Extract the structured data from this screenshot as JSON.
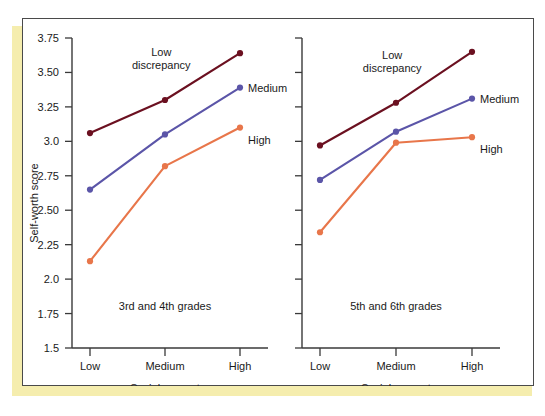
{
  "figure": {
    "y_axis_label": "Self-worth score",
    "colors": {
      "low_discrepancy": "#6b1020",
      "medium": "#5b55a8",
      "high": "#e8764a",
      "axis": "#3a3a3a",
      "accent_band": "#f5edae",
      "panel_border": "#4a4a4a",
      "text": "#1a1a1a"
    }
  },
  "chart_data": [
    {
      "type": "line",
      "title": "3rd and 4th grades",
      "xlabel": "Social support",
      "ylabel": "Self-worth score",
      "categories": [
        "Low",
        "Medium",
        "High"
      ],
      "ylim": [
        1.5,
        3.75
      ],
      "yticks": [
        "1.5",
        "1.75",
        "2.0",
        "2.25",
        "2.50",
        "2.75",
        "3.0",
        "3.25",
        "3.50",
        "3.75"
      ],
      "ytick_values": [
        1.5,
        1.75,
        2.0,
        2.25,
        2.5,
        2.75,
        3.0,
        3.25,
        3.5,
        3.75
      ],
      "grid": false,
      "legend_position": "inline-annotations",
      "series": [
        {
          "name": "Low discrepancy",
          "label": "Low\ndiscrepancy",
          "values": [
            3.06,
            3.3,
            3.64
          ],
          "color": "#6b1020"
        },
        {
          "name": "Medium",
          "label": "Medium",
          "values": [
            2.65,
            3.05,
            3.39
          ],
          "color": "#5b55a8"
        },
        {
          "name": "High",
          "label": "High",
          "values": [
            2.13,
            2.82,
            3.1
          ],
          "color": "#e8764a"
        }
      ]
    },
    {
      "type": "line",
      "title": "5th and 6th grades",
      "xlabel": "Social support",
      "ylabel": "Self-worth score",
      "categories": [
        "Low",
        "Medium",
        "High"
      ],
      "ylim": [
        1.5,
        3.75
      ],
      "yticks": [
        "1.5",
        "1.75",
        "2.0",
        "2.25",
        "2.50",
        "2.75",
        "3.0",
        "3.25",
        "3.50",
        "3.75"
      ],
      "ytick_values": [
        1.5,
        1.75,
        2.0,
        2.25,
        2.5,
        2.75,
        3.0,
        3.25,
        3.5,
        3.75
      ],
      "grid": false,
      "legend_position": "inline-annotations",
      "series": [
        {
          "name": "Low discrepancy",
          "label": "Low\ndiscrepancy",
          "values": [
            2.97,
            3.28,
            3.65
          ],
          "color": "#6b1020"
        },
        {
          "name": "Medium",
          "label": "Medium",
          "values": [
            2.72,
            3.07,
            3.31
          ],
          "color": "#5b55a8"
        },
        {
          "name": "High",
          "label": "High",
          "values": [
            2.34,
            2.99,
            3.03
          ],
          "color": "#e8764a"
        }
      ]
    }
  ],
  "annotations": {
    "low_discrepancy_line1": "Low",
    "low_discrepancy_line2": "discrepancy",
    "medium": "Medium",
    "high": "High"
  }
}
